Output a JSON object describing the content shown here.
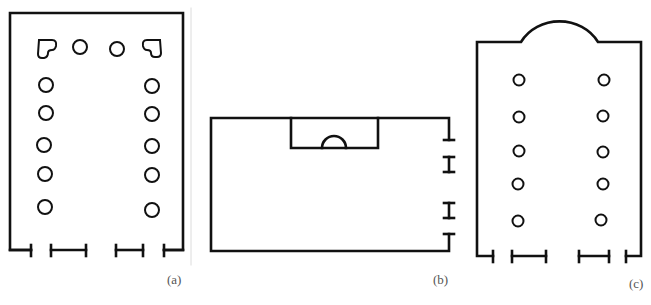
{
  "figure": {
    "stroke_color": "#111111",
    "divider_color": "#d8d8d8",
    "panels": [
      {
        "id": "a",
        "label": "(a)",
        "description": "Rectangular hall with U-shaped colonnade: 2 free columns and 2 heart-shaped corner piers across the back, 5 columns on each side; front wall with 3 openings",
        "columns_left": 5,
        "columns_right": 5,
        "columns_back": 2,
        "corner_piers": 2,
        "front_openings": 3
      },
      {
        "id": "b",
        "label": "(b)",
        "description": "Wide rectangular hall with a rectangular tribunal/niche recess containing a semicircular apse on the long top wall; 3 openings on the right short wall",
        "side_openings": 3,
        "niches": 1
      },
      {
        "id": "c",
        "label": "(c)",
        "description": "Basilica plan with semicircular apse at the top, two rows of 5 columns, front wall with 3 openings",
        "columns_left": 5,
        "columns_right": 5,
        "apses": 1,
        "front_openings": 3
      }
    ]
  }
}
